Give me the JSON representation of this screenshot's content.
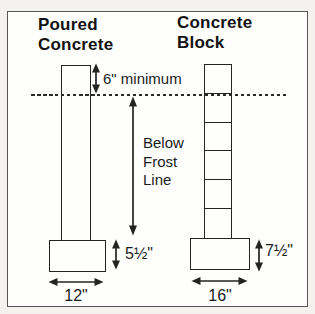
{
  "figure": {
    "left_column": {
      "title_line1": "Poured",
      "title_line2": "Concrete",
      "footing_height": "5½\"",
      "footing_width": "12\""
    },
    "right_column": {
      "title_line1": "Concrete",
      "title_line2": "Block",
      "footing_height": "7½\"",
      "footing_width": "16\""
    },
    "annotations": {
      "min_depth": "6\" minimum",
      "frost_line1": "Below",
      "frost_line2": "Frost",
      "frost_line3": "Line"
    },
    "colors": {
      "line": "#242424",
      "text": "#1c1c1c",
      "canvas": "#fefefd",
      "outside": "#f3f2ef",
      "frame_border": "#555555"
    }
  }
}
